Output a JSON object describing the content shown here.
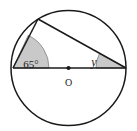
{
  "figure": {
    "name": "circle-inscribed-angle-diagram",
    "background_color": "#ffffff",
    "stroke_color": "#1a1a1a",
    "shade_color": "#c9c9c9",
    "shade_stroke_color": "#8c8c8c"
  },
  "circle": {
    "center_label": "O",
    "center_x": 68.5,
    "center_y": 68,
    "radius": 57.5,
    "stroke_width": 1.4
  },
  "points": {
    "left_vertex": {
      "label": "",
      "x": 13,
      "y": 68
    },
    "right_vertex": {
      "label": "",
      "x": 126,
      "y": 68
    },
    "top_vertex": {
      "label": "",
      "x": 38,
      "y": 19
    },
    "center": {
      "label": "O",
      "x": 68.5,
      "y": 68
    }
  },
  "segments": [
    {
      "name": "diameter",
      "from": "left_vertex",
      "to": "right_vertex"
    },
    {
      "name": "chord-left-top",
      "from": "left_vertex",
      "to": "top_vertex"
    },
    {
      "name": "chord-top-right",
      "from": "top_vertex",
      "to": "right_vertex"
    }
  ],
  "angles": [
    {
      "name": "angle-65-degrees",
      "label": "65°",
      "value": 65,
      "unit": "degrees",
      "at_point": "left_vertex",
      "shaded": true,
      "label_x": 31,
      "label_y": 68
    },
    {
      "name": "angle-y-unknown",
      "label": "y",
      "value": null,
      "unit": "degrees",
      "at_point": "right_vertex",
      "shaded": true,
      "label_x": 94,
      "label_y": 66
    }
  ],
  "center_dot": {
    "name": "center-point-marker",
    "radius": 2.1
  }
}
